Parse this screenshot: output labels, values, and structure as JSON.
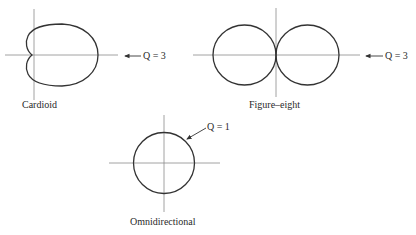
{
  "diagrams": [
    {
      "name": "Cardioid",
      "label": "Cardioid",
      "q_label": "Q = 3"
    },
    {
      "name": "Figure-eight",
      "label": "Figure–eight",
      "q_label": "Q = 3"
    },
    {
      "name": "Omnidirectional",
      "label": "Omnidirectional",
      "q_label": "Q = 1"
    }
  ],
  "colors": {
    "axis": "#8a8a8a",
    "curve": "#333333",
    "text": "#2a2a2a"
  }
}
